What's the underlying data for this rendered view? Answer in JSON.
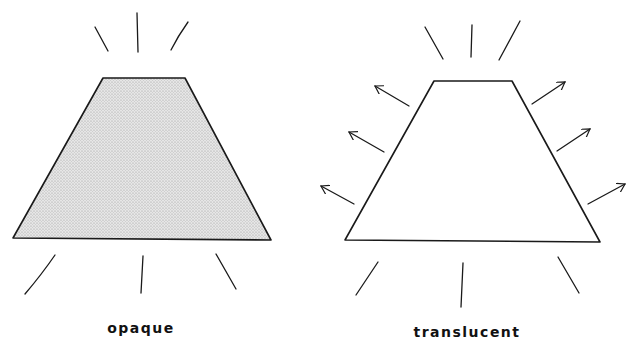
{
  "panels": [
    {
      "id": "opaque",
      "label": "opaque",
      "shape_fill": "stippled light gray",
      "light_rays": "short lines around top and bottom only",
      "arrows": 0
    },
    {
      "id": "translucent",
      "label": "translucent",
      "shape_fill": "white (empty)",
      "light_rays": "short lines around top and bottom",
      "arrows": 6
    }
  ],
  "colors": {
    "stroke": "#1a1a1a",
    "opaque_fill": "#dcdcdc",
    "background": "#ffffff"
  }
}
